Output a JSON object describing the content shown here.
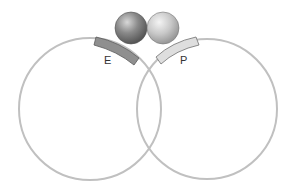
{
  "diagram": {
    "labels": {
      "left_site": "E",
      "right_site": "P"
    },
    "colors": {
      "circle_stroke": "#bdbdbd",
      "left_site_fill": "#8e8e8e",
      "right_site_fill": "#dcdcdc",
      "left_ball": "#7a7a7a",
      "right_ball": "#c4c4c4"
    }
  }
}
